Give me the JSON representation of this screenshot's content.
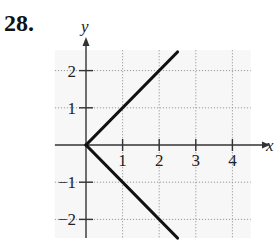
{
  "problem": {
    "number": "28."
  },
  "chart_data": {
    "type": "line",
    "title": "",
    "xlabel": "x",
    "ylabel": "y",
    "xlim": [
      -0.85,
      4.5
    ],
    "ylim": [
      -2.5,
      2.55
    ],
    "grid": true,
    "grid_style": "dotted",
    "x_ticks": [
      1,
      2,
      3,
      4
    ],
    "x_tick_labels": [
      "1",
      "2",
      "3",
      "4"
    ],
    "y_ticks": [
      -2,
      -1,
      1,
      2
    ],
    "y_tick_labels": [
      "−2",
      "−1",
      "1",
      "2"
    ],
    "series": [
      {
        "name": "upper branch",
        "x": [
          0,
          2.5
        ],
        "y": [
          0,
          2.5
        ]
      },
      {
        "name": "lower branch",
        "x": [
          0,
          2.5
        ],
        "y": [
          0,
          -2.5
        ]
      }
    ],
    "colors": {
      "curve": "#111111",
      "axis": "#333333",
      "grid": "#9a9a9a",
      "background": "#f7f7f7"
    }
  }
}
